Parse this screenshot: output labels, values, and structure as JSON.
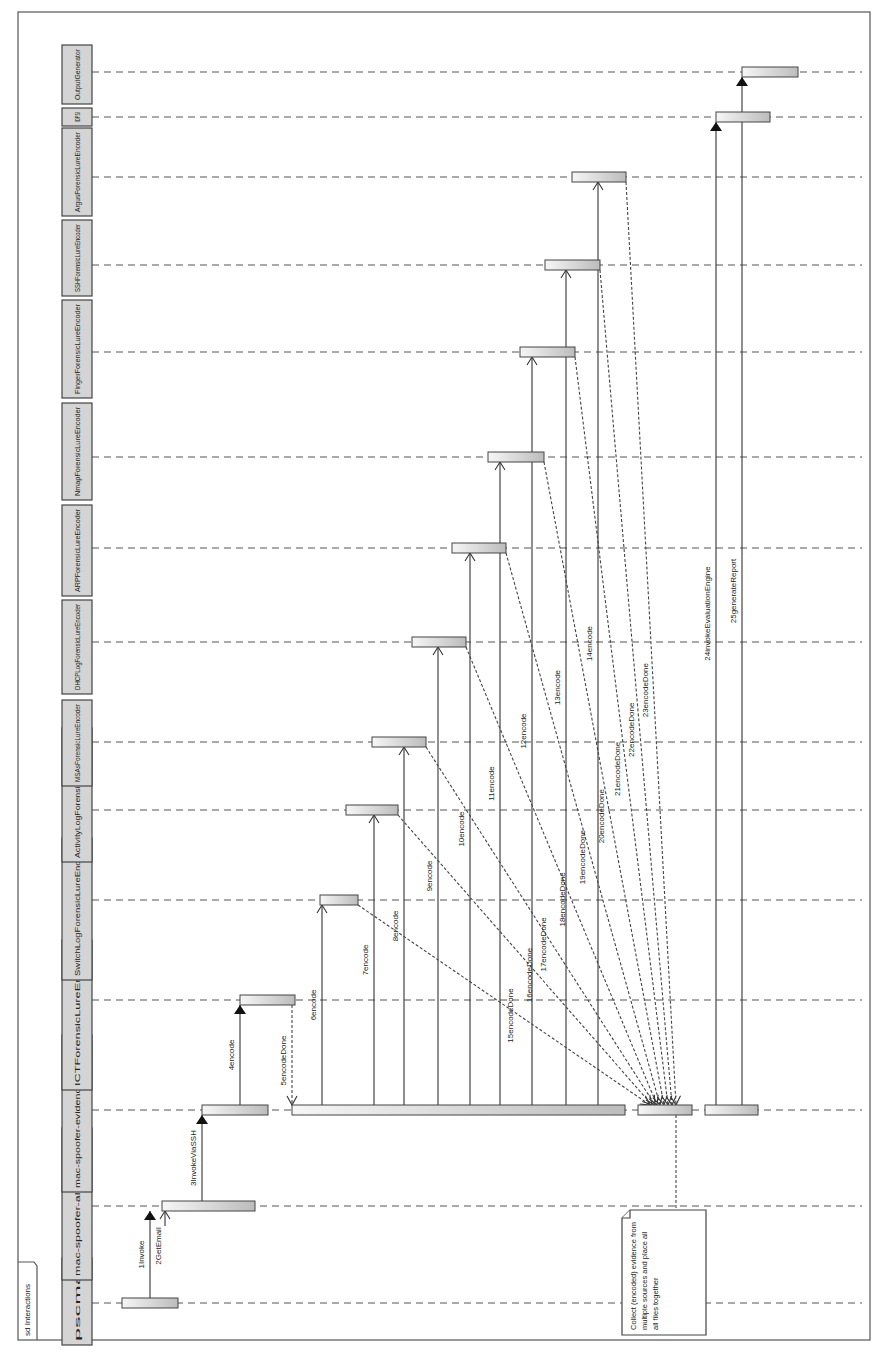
{
  "frame": {
    "label": "sd Interactions"
  },
  "participants": [
    {
      "id": "pscmail",
      "name": "pscmail",
      "y": 1303,
      "hdr_top": 1258,
      "hdr_bottom": 1345
    },
    {
      "id": "alert",
      "name": "mac-spoofer-alert-handler",
      "y": 1206,
      "hdr_top": 1128,
      "hdr_bottom": 1280
    },
    {
      "id": "collector",
      "name": "mac-spoofer-evidence-collector",
      "y": 1110,
      "hdr_top": 1035,
      "hdr_bottom": 1192
    },
    {
      "id": "ict",
      "name": "ICTForensicLureEncoder",
      "y": 1000,
      "hdr_top": 940,
      "hdr_bottom": 1090
    },
    {
      "id": "switch",
      "name": "SwitchLogForensicLureEncoder",
      "y": 900,
      "hdr_top": 838,
      "hdr_bottom": 980
    },
    {
      "id": "activity",
      "name": "ActivityLogForensicLureEncoder",
      "y": 810,
      "hdr_top": 728,
      "hdr_bottom": 862
    },
    {
      "id": "msas",
      "name": "MSAsForensicLureEncoder",
      "y": 742,
      "hdr_top": 700,
      "hdr_bottom": 786
    },
    {
      "id": "dhcp",
      "name": "DHCPLogForensicLureEncoder",
      "y": 642,
      "hdr_top": 600,
      "hdr_bottom": 694
    },
    {
      "id": "arp",
      "name": "ARPForensicLureEncoder",
      "y": 548,
      "hdr_top": 505,
      "hdr_bottom": 596
    },
    {
      "id": "nmap",
      "name": "NmapForensicLureEncoder",
      "y": 457,
      "hdr_top": 403,
      "hdr_bottom": 500
    },
    {
      "id": "finger",
      "name": "FingerForensicLureEncoder",
      "y": 352,
      "hdr_top": 300,
      "hdr_bottom": 398
    },
    {
      "id": "ssh",
      "name": "SSHForensicLureEncoder",
      "y": 265,
      "hdr_top": 220,
      "hdr_bottom": 296
    },
    {
      "id": "argus",
      "name": "ArgusForensicLureEncoder",
      "y": 177,
      "hdr_top": 128,
      "hdr_bottom": 216
    },
    {
      "id": "idps",
      "name": "IDPSI",
      "y": 117,
      "hdr_top": 108,
      "hdr_bottom": 126
    },
    {
      "id": "output",
      "name": "OutputGenerator",
      "y": 72,
      "hdr_top": 45,
      "hdr_bottom": 104
    }
  ],
  "activations": [
    {
      "participant": "pscmail",
      "x1": 122,
      "x2": 178
    },
    {
      "participant": "alert",
      "x1": 162,
      "x2": 255
    },
    {
      "participant": "collector",
      "x1": 202,
      "x2": 268
    },
    {
      "participant": "ict",
      "x1": 240,
      "x2": 295
    },
    {
      "participant": "collector",
      "x1": 292,
      "x2": 625
    },
    {
      "participant": "switch",
      "x1": 320,
      "x2": 358
    },
    {
      "participant": "activity",
      "x1": 346,
      "x2": 398
    },
    {
      "participant": "msas",
      "x1": 372,
      "x2": 426
    },
    {
      "participant": "dhcp",
      "x1": 412,
      "x2": 466
    },
    {
      "participant": "arp",
      "x1": 452,
      "x2": 506
    },
    {
      "participant": "nmap",
      "x1": 488,
      "x2": 544
    },
    {
      "participant": "finger",
      "x1": 520,
      "x2": 575
    },
    {
      "participant": "ssh",
      "x1": 545,
      "x2": 600
    },
    {
      "participant": "argus",
      "x1": 572,
      "x2": 626
    },
    {
      "participant": "collector",
      "x1": 638,
      "x2": 692
    },
    {
      "participant": "collector",
      "x1": 705,
      "x2": 758
    },
    {
      "participant": "idps",
      "x1": 716,
      "x2": 770
    },
    {
      "participant": "output",
      "x1": 742,
      "x2": 798
    }
  ],
  "messages": [
    {
      "n": 1,
      "label": "1Invoke",
      "type": "call",
      "x": 150,
      "from": "pscmail",
      "to": "alert"
    },
    {
      "n": 2,
      "label": "2GetEmail",
      "type": "self",
      "x": 165,
      "from": "alert",
      "to": "alert"
    },
    {
      "n": 3,
      "label": "3InvokeViaSSH",
      "type": "call",
      "x": 202,
      "from": "alert",
      "to": "collector"
    },
    {
      "n": 4,
      "label": "4encode",
      "type": "call",
      "x": 240,
      "from": "collector",
      "to": "ict"
    },
    {
      "n": 5,
      "label": "5encodeDone",
      "type": "return",
      "x": 292,
      "from": "ict",
      "to": "collector"
    },
    {
      "n": 6,
      "label": "6encode",
      "type": "call",
      "x": 322,
      "from": "collector",
      "to": "switch"
    },
    {
      "n": 7,
      "label": "7encode",
      "type": "call",
      "x": 374,
      "from": "collector",
      "to": "activity"
    },
    {
      "n": 8,
      "label": "8encode",
      "type": "call",
      "x": 404,
      "from": "collector",
      "to": "msas"
    },
    {
      "n": 9,
      "label": "9encode",
      "type": "call",
      "x": 438,
      "from": "collector",
      "to": "dhcp"
    },
    {
      "n": 10,
      "label": "10encode",
      "type": "call",
      "x": 470,
      "from": "collector",
      "to": "arp"
    },
    {
      "n": 11,
      "label": "11encode",
      "type": "call",
      "x": 500,
      "from": "collector",
      "to": "nmap"
    },
    {
      "n": 12,
      "label": "12encode",
      "type": "call",
      "x": 532,
      "from": "collector",
      "to": "finger"
    },
    {
      "n": 13,
      "label": "13encode",
      "type": "call",
      "x": 566,
      "from": "collector",
      "to": "ssh"
    },
    {
      "n": 14,
      "label": "14encode",
      "type": "call",
      "x": 598,
      "from": "collector",
      "to": "argus"
    },
    {
      "n": 15,
      "label": "15encodeDone",
      "type": "return",
      "x": 358,
      "from": "switch",
      "to": "collector",
      "to_x": 650
    },
    {
      "n": 16,
      "label": "16encodeDone",
      "type": "return",
      "x": 398,
      "from": "activity",
      "to": "collector",
      "to_x": 652
    },
    {
      "n": 17,
      "label": "17encodeDone",
      "type": "return",
      "x": 426,
      "from": "msas",
      "to": "collector",
      "to_x": 655
    },
    {
      "n": 18,
      "label": "18encodeDone",
      "type": "return",
      "x": 466,
      "from": "dhcp",
      "to": "collector",
      "to_x": 657
    },
    {
      "n": 19,
      "label": "19encodeDone",
      "type": "return",
      "x": 506,
      "from": "arp",
      "to": "collector",
      "to_x": 660
    },
    {
      "n": 20,
      "label": "20encodeDone",
      "type": "return",
      "x": 544,
      "from": "nmap",
      "to": "collector",
      "to_x": 664
    },
    {
      "n": 21,
      "label": "21encodeDone",
      "type": "return",
      "x": 575,
      "from": "finger",
      "to": "collector",
      "to_x": 668
    },
    {
      "n": 22,
      "label": "22encodeDone",
      "type": "return",
      "x": 600,
      "from": "ssh",
      "to": "collector",
      "to_x": 672
    },
    {
      "n": 23,
      "label": "23encodeDone",
      "type": "return",
      "x": 626,
      "from": "argus",
      "to": "collector",
      "to_x": 676
    },
    {
      "n": 24,
      "label": "24invokeEvaluationEngine",
      "type": "call",
      "x": 716,
      "from": "collector",
      "to": "idps"
    },
    {
      "n": 25,
      "label": "25generateReport",
      "type": "call",
      "x": 742,
      "from": "collector",
      "to": "output"
    }
  ],
  "note": {
    "text_lines": [
      "Collect (encoded) evidence from",
      "multiple sources and place all",
      "all files together"
    ],
    "attached_to": "collector",
    "x1": 622,
    "x2": 706,
    "y1": 1210,
    "y2": 1335
  },
  "colors": {
    "header_fill": "#d4d4d4",
    "activation_light": "#f4f4f4",
    "activation_dark": "#bdbdbd",
    "line": "#333333"
  }
}
